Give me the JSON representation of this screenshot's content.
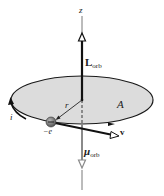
{
  "figure": {
    "labels": {
      "z_axis": "z",
      "angular_momentum": "L",
      "angular_momentum_sub": "orb",
      "radius": "r",
      "area": "A",
      "current": "i",
      "electron_charge": "−e",
      "velocity": "v",
      "magnetic_moment": "μ",
      "magnetic_moment_sub": "orb"
    },
    "colors": {
      "orbit_fill": "#dcdcdc",
      "orbit_stroke": "#1a1a1a",
      "axis": "#555555",
      "L_arrow": "#111111",
      "mu_arrow": "#8a8a8a",
      "electron": "#7a7a7a"
    }
  }
}
